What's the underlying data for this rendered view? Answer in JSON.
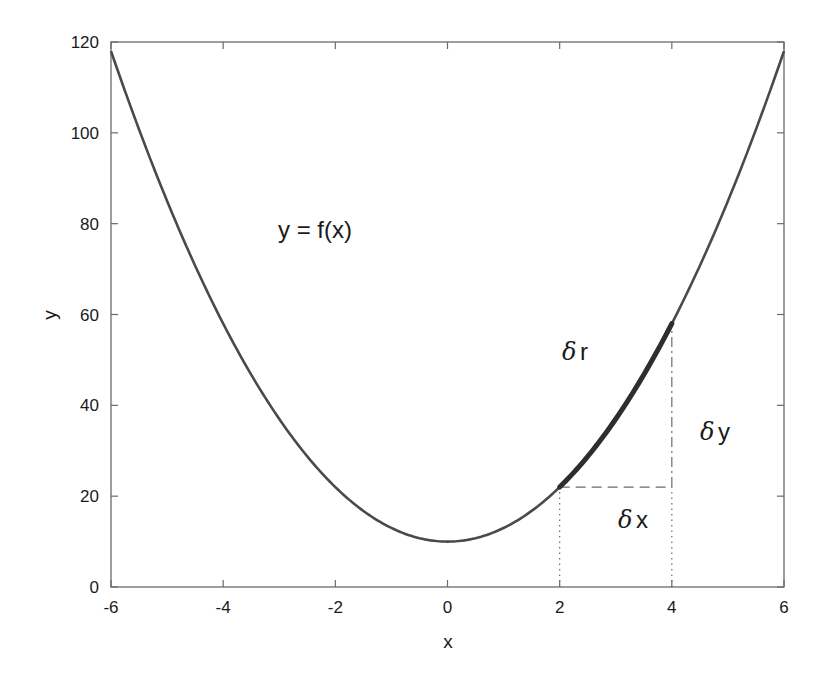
{
  "chart_data": {
    "type": "line",
    "title": "",
    "xlabel": "x",
    "ylabel": "y",
    "xlim": [
      -6,
      6
    ],
    "ylim": [
      0,
      120
    ],
    "xticks": [
      -6,
      -4,
      -2,
      0,
      2,
      4,
      6
    ],
    "yticks": [
      0,
      20,
      40,
      60,
      80,
      100,
      120
    ],
    "xtick_labels": [
      "-6",
      "-4",
      "-2",
      "0",
      "2",
      "4",
      "6"
    ],
    "ytick_labels": [
      "0",
      "20",
      "40",
      "60",
      "80",
      "100",
      "120"
    ],
    "grid": false,
    "legend": null,
    "series": [
      {
        "name": "y = f(x)",
        "function": "y = 3x^2 + 10",
        "x": [
          -6,
          -5,
          -4,
          -3,
          -2,
          -1,
          0,
          1,
          2,
          3,
          4,
          5,
          6
        ],
        "y": [
          118,
          85,
          58,
          37,
          22,
          13,
          10,
          13,
          22,
          37,
          58,
          85,
          118
        ],
        "color": "#4a4a4a"
      },
      {
        "name": "δr segment (highlighted)",
        "x": [
          2,
          2.5,
          3,
          3.5,
          4
        ],
        "y": [
          22,
          28.75,
          37,
          46.75,
          58
        ],
        "color": "#2e2e2e",
        "style": "thick"
      }
    ],
    "annotations": [
      {
        "text": "y = f(x)",
        "x": -2.2,
        "y": 80
      },
      {
        "text": "δr",
        "x": 0.9,
        "y": 52,
        "greek": "δ",
        "var": "r"
      },
      {
        "text": "δy",
        "x": 4.6,
        "y": 40,
        "greek": "δ",
        "var": "y"
      },
      {
        "text": "δx",
        "x": 2.6,
        "y": 13,
        "greek": "δ",
        "var": "x"
      }
    ],
    "guide_lines": [
      {
        "type": "dotted",
        "from": [
          2,
          0
        ],
        "to": [
          2,
          22
        ]
      },
      {
        "type": "dotted",
        "from": [
          4,
          0
        ],
        "to": [
          4,
          22
        ]
      },
      {
        "type": "dashed",
        "from": [
          2,
          22
        ],
        "to": [
          4,
          22
        ],
        "label": "δx"
      },
      {
        "type": "dashdot",
        "from": [
          4,
          22
        ],
        "to": [
          4,
          58
        ],
        "label": "δy"
      }
    ]
  },
  "labels": {
    "xlabel": "x",
    "ylabel": "y",
    "fx": "y = f(x)",
    "delta": "δ",
    "dr_var": "r",
    "dy_var": "y",
    "dx_var": "x"
  }
}
